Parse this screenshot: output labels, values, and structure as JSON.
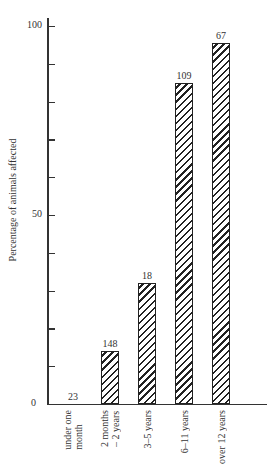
{
  "chart_data": {
    "type": "bar",
    "title": "",
    "xlabel": "",
    "ylabel": "Percentage of animals affected",
    "ylim": [
      0,
      100
    ],
    "y_ticks": [
      0,
      10,
      20,
      30,
      40,
      50,
      60,
      70,
      80,
      90,
      100
    ],
    "y_tick_labels": [
      "0",
      "50",
      "100"
    ],
    "grid": false,
    "legend": null,
    "pattern": "diagonal hatch",
    "categories": [
      "under one month",
      "2 months – 2 years",
      "3–5 years",
      "6–11 years",
      "over 12 years"
    ],
    "category_lines": [
      [
        "under one",
        "month"
      ],
      [
        "2 months",
        "– 2 years"
      ],
      [
        "3–5 years"
      ],
      [
        "6–11 years"
      ],
      [
        "over 12 years"
      ]
    ],
    "values": [
      0,
      14,
      32,
      85,
      95.5
    ],
    "bar_labels": [
      "23",
      "148",
      "18",
      "109",
      "67"
    ]
  }
}
